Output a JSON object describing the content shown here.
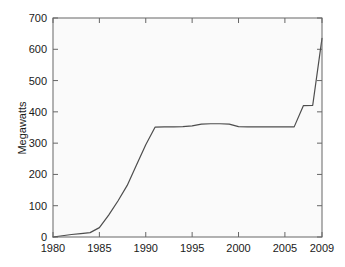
{
  "chart_data": {
    "type": "line",
    "title": "",
    "subtitle": "",
    "xlabel": "",
    "ylabel": "Megawatts",
    "xlim": [
      1980,
      2009
    ],
    "ylim": [
      0,
      700
    ],
    "xticks": [
      1980,
      1985,
      1990,
      1995,
      2000,
      2005,
      2009
    ],
    "yticks": [
      0,
      100,
      200,
      300,
      400,
      500,
      600,
      700
    ],
    "xtick_labels": [
      "1980",
      "1985",
      "1990",
      "1995",
      "2000",
      "2005",
      "2009"
    ],
    "ytick_labels": [
      "0",
      "100",
      "200",
      "300",
      "400",
      "500",
      "600",
      "700"
    ],
    "grid": false,
    "legend": null,
    "legend_position": "none",
    "annotations": [],
    "line_color": "#4d4d4d",
    "line_width": 1.2,
    "axis_color": "#666666",
    "plot_background": "#fafafa",
    "series": [
      {
        "name": "Megawatts",
        "x": [
          1980,
          1981,
          1982,
          1983,
          1984,
          1985,
          1986,
          1987,
          1988,
          1989,
          1990,
          1991,
          1992,
          1993,
          1994,
          1995,
          1996,
          1997,
          1998,
          1999,
          2000,
          2001,
          2002,
          2003,
          2004,
          2005,
          2006,
          2007,
          2008,
          2009
        ],
        "values": [
          0,
          4,
          8,
          11,
          14,
          30,
          70,
          115,
          165,
          230,
          295,
          351,
          352,
          352,
          353,
          355,
          361,
          362,
          362,
          361,
          353,
          352,
          352,
          352,
          352,
          352,
          352,
          420,
          421,
          635
        ]
      }
    ]
  },
  "figure": {
    "y_axis_title": "Megawatts"
  }
}
